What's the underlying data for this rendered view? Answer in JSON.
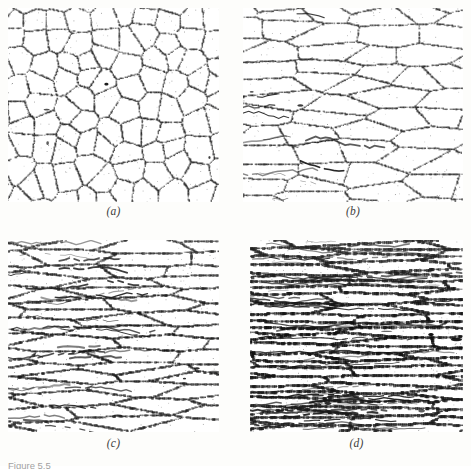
{
  "figure": {
    "caption_partial": "Figure 5.5",
    "panel_count": 4,
    "panels": [
      {
        "id": "a",
        "label": "(a)",
        "description": "equiaxed polygonal grains with dark grain boundaries, undeformed",
        "elongation": 1.0,
        "boundary_density": 1.0,
        "grain_size": 22,
        "darkness": 0.55
      },
      {
        "id": "b",
        "label": "(b)",
        "description": "grains moderately elongated in the horizontal rolling direction",
        "elongation": 3.2,
        "boundary_density": 1.05,
        "grain_size": 17,
        "darkness": 0.5
      },
      {
        "id": "c",
        "label": "(c)",
        "description": "grains strongly flattened into horizontal bands",
        "elongation": 7.0,
        "boundary_density": 1.5,
        "grain_size": 12,
        "darkness": 0.62
      },
      {
        "id": "d",
        "label": "(d)",
        "description": "severely elongated fine fibrous streaks, heavily deformed",
        "elongation": 12.0,
        "boundary_density": 2.1,
        "grain_size": 8,
        "darkness": 0.7
      }
    ]
  },
  "colors": {
    "ink": "#151515",
    "paper": "#ffffff",
    "sheet": "#fdfdfb",
    "label_text": "#3c3c3c",
    "caption_text": "#6f6f6f"
  }
}
